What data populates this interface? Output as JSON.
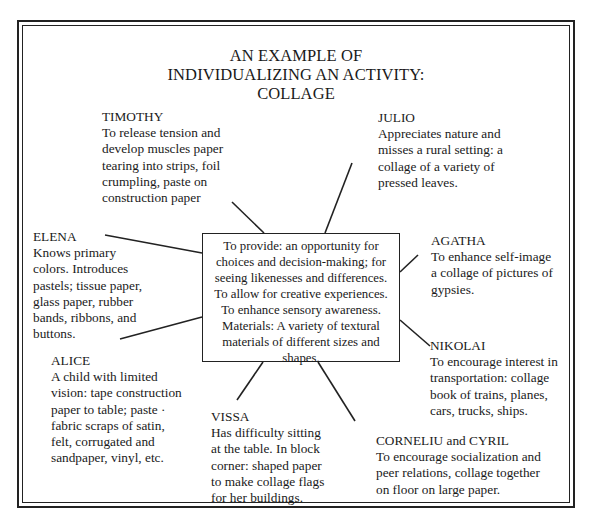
{
  "title": {
    "line1": "AN EXAMPLE OF",
    "line2": "INDIVIDUALIZING AN ACTIVITY:",
    "line3": "COLLAGE"
  },
  "center": {
    "text": "To provide:  an opportunity for\nchoices and decision-making; for\nseeing likenesses and differences.\nTo allow for creative experiences.\nTo enhance sensory awareness.\nMaterials:  A variety of textural\nmaterials of different sizes and\nshapes."
  },
  "children": {
    "timothy": {
      "name": "TIMOTHY",
      "desc": "To release tension and\ndevelop muscles  paper\ntearing into strips, foil\ncrumpling, paste on\nconstruction paper"
    },
    "julio": {
      "name": "JULIO",
      "desc": "Appreciates nature and\nmisses a rural setting:  a\ncollage of a variety of\npressed leaves."
    },
    "elena": {
      "name": "ELENA",
      "desc": "Knows primary\ncolors.  Introduces\npastels; tissue paper,\nglass paper, rubber\nbands, ribbons, and\nbuttons."
    },
    "agatha": {
      "name": "AGATHA",
      "desc": "To enhance self-image\na collage of pictures of\ngypsies."
    },
    "alice": {
      "name": "ALICE",
      "desc": "A child with limited\nvision:  tape construction\npaper to table;  paste ·\nfabric scraps of satin,\nfelt, corrugated and\nsandpaper, vinyl, etc."
    },
    "nikolai": {
      "name": "NIKOLAI",
      "desc": "To encourage interest in\ntransportation:  collage\nbook of trains, planes,\ncars, trucks, ships."
    },
    "vissa": {
      "name": "VISSA",
      "desc": "Has difficulty sitting\nat the table.  In block\ncorner:  shaped paper\nto make collage flags\nfor her buildings."
    },
    "corneliu_cyril": {
      "name": "CORNELIU and CYRIL",
      "desc": "To encourage socialization and\npeer relations, collage together\non floor on large paper."
    }
  }
}
